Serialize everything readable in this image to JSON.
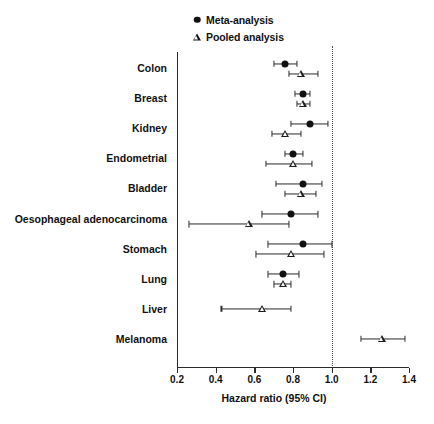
{
  "figure": {
    "xaxis_title": "Hazard ratio (95% CI)"
  },
  "legend": {
    "items": [
      {
        "label": "Meta-analysis",
        "marker": "filled-circle-icon"
      },
      {
        "label": "Pooled analysis",
        "marker": "open-triangle-icon"
      }
    ]
  },
  "chart_data": {
    "type": "scatter",
    "subtype": "forest-plot",
    "title": "",
    "xlabel": "Hazard ratio (95% CI)",
    "ylabel": "",
    "xlim": [
      0.2,
      1.4
    ],
    "xticks": [
      0.2,
      0.4,
      0.6,
      0.8,
      1.0,
      1.2,
      1.4
    ],
    "xtick_labels": [
      "0.2",
      "0.4",
      "0.6",
      "0.8",
      "1.0",
      "1.2",
      "1.4"
    ],
    "reference_line": 1.0,
    "grid": false,
    "legend_position": "top-center",
    "categories": [
      "Colon",
      "Breast",
      "Kidney",
      "Endometrial",
      "Bladder",
      "Oesophageal adenocarcinoma",
      "Stomach",
      "Lung",
      "Liver",
      "Melanoma"
    ],
    "series": [
      {
        "name": "Meta-analysis",
        "marker": "filled-circle",
        "values": [
          {
            "category": "Colon",
            "hr": 0.76,
            "lo": 0.7,
            "hi": 0.82
          },
          {
            "category": "Breast",
            "hr": 0.85,
            "lo": 0.81,
            "hi": 0.89
          },
          {
            "category": "Kidney",
            "hr": 0.89,
            "lo": 0.79,
            "hi": 0.98
          },
          {
            "category": "Endometrial",
            "hr": 0.8,
            "lo": 0.76,
            "hi": 0.85
          },
          {
            "category": "Bladder",
            "hr": 0.85,
            "lo": 0.71,
            "hi": 0.95
          },
          {
            "category": "Oesophageal adenocarcinoma",
            "hr": 0.79,
            "lo": 0.64,
            "hi": 0.93
          },
          {
            "category": "Stomach",
            "hr": 0.85,
            "lo": 0.67,
            "hi": 1.0
          },
          {
            "category": "Lung",
            "hr": 0.75,
            "lo": 0.67,
            "hi": 0.83
          },
          {
            "category": "Liver",
            "hr": null,
            "lo": null,
            "hi": null
          },
          {
            "category": "Melanoma",
            "hr": null,
            "lo": null,
            "hi": null
          }
        ]
      },
      {
        "name": "Pooled analysis",
        "marker": "open-triangle",
        "values": [
          {
            "category": "Colon",
            "hr": 0.84,
            "lo": 0.78,
            "hi": 0.93
          },
          {
            "category": "Breast",
            "hr": 0.85,
            "lo": 0.82,
            "hi": 0.89
          },
          {
            "category": "Kidney",
            "hr": 0.76,
            "lo": 0.69,
            "hi": 0.84
          },
          {
            "category": "Endometrial",
            "hr": 0.8,
            "lo": 0.66,
            "hi": 0.9
          },
          {
            "category": "Bladder",
            "hr": 0.84,
            "lo": 0.76,
            "hi": 0.92
          },
          {
            "category": "Oesophageal adenocarcinoma",
            "hr": 0.57,
            "lo": 0.26,
            "hi": 0.78
          },
          {
            "category": "Stomach",
            "hr": 0.79,
            "lo": 0.61,
            "hi": 0.96
          },
          {
            "category": "Lung",
            "hr": 0.75,
            "lo": 0.7,
            "hi": 0.79
          },
          {
            "category": "Liver",
            "hr": 0.64,
            "lo": 0.43,
            "hi": 0.79
          },
          {
            "category": "Melanoma",
            "hr": 1.26,
            "lo": 1.15,
            "hi": 1.38
          }
        ]
      }
    ]
  }
}
